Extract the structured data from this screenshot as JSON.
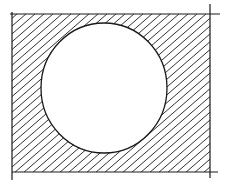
{
  "figure": {
    "description": "Hand-drawn sketch: rectangle with hatched fill and a white circle cut out",
    "background": "#ffffff",
    "stroke_color": "#1a1a1a",
    "rectangle": {
      "x": 12,
      "y": 14,
      "width": 198,
      "height": 158
    },
    "circle": {
      "cx": 104,
      "cy": 88,
      "rx": 63,
      "ry": 65
    },
    "hatch": {
      "angle_deg": -40,
      "spacing": 9
    }
  }
}
